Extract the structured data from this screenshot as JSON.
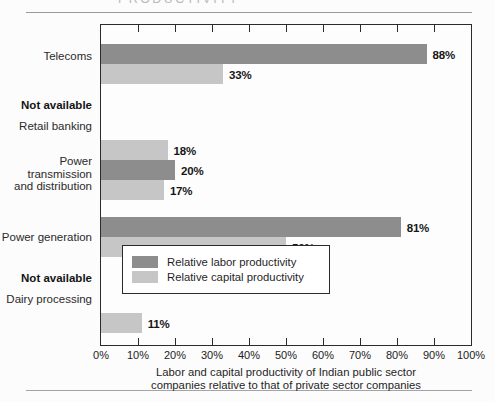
{
  "page": {
    "title_partial": "PRODUCTIVITY"
  },
  "chart_data": {
    "type": "bar",
    "orientation": "horizontal",
    "title": "PRODUCTIVITY",
    "xlabel": "Labor and capital productivity of Indian public sector\ncompanies relative to that of private sector companies",
    "ylabel": "",
    "xlim": [
      0,
      100
    ],
    "xtick_labels": [
      "0%",
      "10%",
      "20%",
      "30%",
      "40%",
      "50%",
      "60%",
      "70%",
      "80%",
      "90%",
      "100%"
    ],
    "xtick_values": [
      0,
      10,
      20,
      30,
      40,
      50,
      60,
      70,
      80,
      90,
      100
    ],
    "grid": false,
    "legend_position": "inside-bottom-right",
    "categories": [
      "Telecoms",
      "Retail banking",
      "Power\ntransmission\nand distribution",
      "Power generation",
      "Dairy processing"
    ],
    "series": [
      {
        "name": "Relative labor productivity",
        "color": "#8d8d8d",
        "values": [
          88,
          null,
          20,
          81,
          null
        ],
        "labels": [
          "88%",
          "Not available",
          "20%",
          "81%",
          "Not available"
        ]
      },
      {
        "name": "Relative capital productivity",
        "color": "#c6c6c6",
        "values": [
          33,
          18,
          17,
          50,
          11
        ],
        "labels": [
          "33%",
          "18%",
          "17%",
          "50%",
          "11%"
        ]
      }
    ],
    "not_available_text": "Not available",
    "rows": [
      {
        "category": "Telecoms",
        "labor": 88,
        "labor_label": "88%",
        "capital": 33,
        "capital_label": "33%",
        "labor_not_available": false
      },
      {
        "category": "Retail banking",
        "labor": null,
        "labor_label": "Not available",
        "capital": 18,
        "capital_label": "18%",
        "labor_not_available": true
      },
      {
        "category": "Power\ntransmission\nand distribution",
        "labor": 20,
        "labor_label": "20%",
        "capital": 17,
        "capital_label": "17%",
        "labor_not_available": false
      },
      {
        "category": "Power generation",
        "labor": 81,
        "labor_label": "81%",
        "capital": 50,
        "capital_label": "50%",
        "labor_not_available": false
      },
      {
        "category": "Dairy processing",
        "labor": null,
        "labor_label": "Not available",
        "capital": 11,
        "capital_label": "11%",
        "labor_not_available": true
      }
    ]
  },
  "legend": {
    "items": [
      {
        "label": "Relative labor productivity",
        "color": "#8d8d8d"
      },
      {
        "label": "Relative capital productivity",
        "color": "#c6c6c6"
      }
    ]
  },
  "xticks": {
    "t0": "0%",
    "t1": "10%",
    "t2": "20%",
    "t3": "30%",
    "t4": "40%",
    "t5": "50%",
    "t6": "60%",
    "t7": "70%",
    "t8": "80%",
    "t9": "90%",
    "t10": "100%"
  },
  "axis_caption": "Labor and capital productivity of Indian public sector\ncompanies relative to that of private sector companies"
}
